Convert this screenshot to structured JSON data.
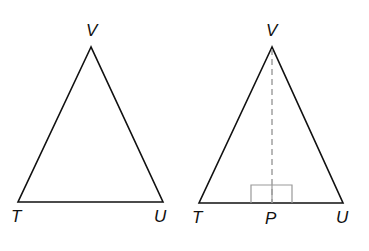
{
  "figures": [
    {
      "name": "triangle-tuv",
      "labels": {
        "apex": "V",
        "left": "T",
        "right": "U"
      }
    },
    {
      "name": "triangle-tuv-with-altitude",
      "labels": {
        "apex": "V",
        "left": "T",
        "foot": "P",
        "right": "U"
      },
      "altitude": "VP",
      "right_angle_at": "P"
    }
  ],
  "colors": {
    "stroke": "#111111",
    "dashed": "#888888",
    "right_angle_mark": "#999999"
  }
}
